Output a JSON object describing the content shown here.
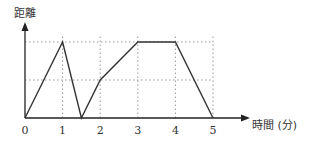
{
  "chart_data": {
    "type": "line",
    "title": "",
    "xlabel": "時間 (分)",
    "ylabel": "距離",
    "x_ticks": [
      "0",
      "1",
      "2",
      "3",
      "4",
      "5"
    ],
    "xlim": [
      0,
      5
    ],
    "ylim": [
      0,
      2
    ],
    "grid": "dotted",
    "grid_y_levels": [
      1,
      2
    ],
    "series": [
      {
        "name": "距離",
        "points": [
          [
            0,
            0
          ],
          [
            1,
            2
          ],
          [
            1.5,
            0
          ],
          [
            2,
            1
          ],
          [
            3,
            2
          ],
          [
            4,
            2
          ],
          [
            5,
            0
          ]
        ]
      }
    ],
    "colors": {
      "line": "#333333",
      "grid": "#999999",
      "axis": "#222222"
    }
  }
}
